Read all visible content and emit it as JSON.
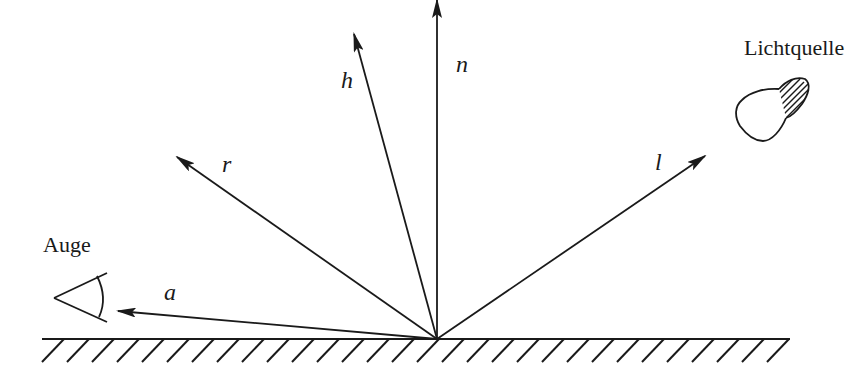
{
  "diagram": {
    "type": "phong-reflection-vectors",
    "colors": {
      "stroke": "#1a1a1a",
      "background": "#ffffff"
    },
    "surface": {
      "y": 339,
      "x_start": 42,
      "x_end": 790,
      "hatch_spacing": 25,
      "hatch_dx": -22,
      "hatch_dy": 23
    },
    "origin": {
      "x": 437,
      "y": 339
    },
    "vectors": [
      {
        "id": "a",
        "label": "a",
        "tip": {
          "x": 118,
          "y": 311
        },
        "label_pos": {
          "x": 164,
          "y": 300
        }
      },
      {
        "id": "r",
        "label": "r",
        "tip": {
          "x": 177,
          "y": 157
        },
        "label_pos": {
          "x": 222,
          "y": 172
        }
      },
      {
        "id": "h",
        "label": "h",
        "tip": {
          "x": 354,
          "y": 34
        },
        "label_pos": {
          "x": 341,
          "y": 88
        }
      },
      {
        "id": "n",
        "label": "n",
        "tip": {
          "x": 437,
          "y": 0
        },
        "label_pos": {
          "x": 456,
          "y": 72
        }
      },
      {
        "id": "l",
        "label": "l",
        "tip": {
          "x": 705,
          "y": 156
        },
        "label_pos": {
          "x": 655,
          "y": 170
        }
      }
    ],
    "objects": {
      "eye": {
        "label": "Auge",
        "label_pos": {
          "x": 43,
          "y": 252
        }
      },
      "light_source": {
        "label": "Lichtquelle",
        "label_pos": {
          "x": 744,
          "y": 55
        }
      }
    }
  }
}
